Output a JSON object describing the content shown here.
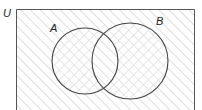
{
  "diagram": {
    "type": "venn",
    "universe_label": "U",
    "sets": [
      {
        "label": "A",
        "cx": 85,
        "cy": 61,
        "r": 33
      },
      {
        "label": "B",
        "cx": 130,
        "cy": 61,
        "r": 38
      }
    ],
    "frame": {
      "x": 16,
      "y": 9,
      "width": 179,
      "height": 110
    },
    "shading": {
      "outside": "single-diagonal-hatch",
      "intersection_A_B": "single-diagonal-hatch",
      "A_only": "cross-hatch",
      "B_only": "cross-hatch"
    },
    "colors": {
      "outline": "#444444",
      "hatch": "#d8d8d8",
      "background": "#ffffff"
    }
  }
}
